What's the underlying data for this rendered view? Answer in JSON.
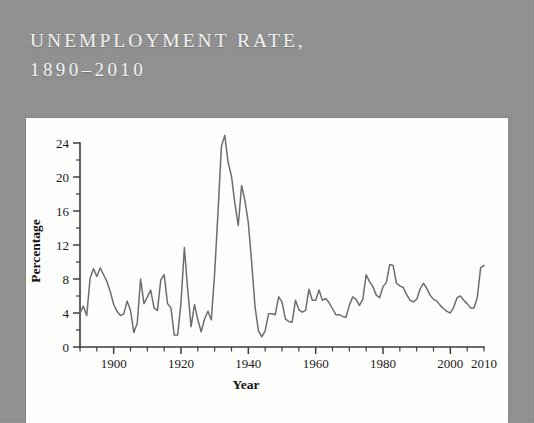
{
  "figure": {
    "background_color": "#909090",
    "panel_color": "#fdfdfb",
    "title_color": "#f2f2f2",
    "line_color": "#6d6d6d",
    "title_line_1": "UNEMPLOYMENT RATE,",
    "title_line_2": "1890–2010"
  },
  "chart_data": {
    "type": "line",
    "title": "UNEMPLOYMENT RATE, 1890–2010",
    "xlabel": "Year",
    "ylabel": "Percentage",
    "xlim": [
      1890,
      2010
    ],
    "ylim": [
      0,
      24
    ],
    "grid": false,
    "legend": "none",
    "x_tick_labels": [
      "1900",
      "1920",
      "1940",
      "1960",
      "1980",
      "2000",
      "2010"
    ],
    "x_tick_values": [
      1900,
      1920,
      1940,
      1960,
      1980,
      2000,
      2010
    ],
    "x_minor_tick_step": 5,
    "y_tick_labels": [
      "0",
      "4",
      "8",
      "12",
      "16",
      "20",
      "24"
    ],
    "y_tick_values": [
      0,
      4,
      8,
      12,
      16,
      20,
      24
    ],
    "y_minor_tick_step": 2,
    "series": [
      {
        "name": "Unemployment rate",
        "color": "#6d6d6d",
        "x": [
          1890,
          1891,
          1892,
          1893,
          1894,
          1895,
          1896,
          1897,
          1898,
          1899,
          1900,
          1901,
          1902,
          1903,
          1904,
          1905,
          1906,
          1907,
          1908,
          1909,
          1910,
          1911,
          1912,
          1913,
          1914,
          1915,
          1916,
          1917,
          1918,
          1919,
          1920,
          1921,
          1922,
          1923,
          1924,
          1925,
          1926,
          1927,
          1928,
          1929,
          1930,
          1931,
          1932,
          1933,
          1934,
          1935,
          1936,
          1937,
          1938,
          1939,
          1940,
          1941,
          1942,
          1943,
          1944,
          1945,
          1946,
          1947,
          1948,
          1949,
          1950,
          1951,
          1952,
          1953,
          1954,
          1955,
          1956,
          1957,
          1958,
          1959,
          1960,
          1961,
          1962,
          1963,
          1964,
          1965,
          1966,
          1967,
          1968,
          1969,
          1970,
          1971,
          1972,
          1973,
          1974,
          1975,
          1976,
          1977,
          1978,
          1979,
          1980,
          1981,
          1982,
          1983,
          1984,
          1985,
          1986,
          1987,
          1988,
          1989,
          1990,
          1991,
          1992,
          1993,
          1994,
          1995,
          1996,
          1997,
          1998,
          1999,
          2000,
          2001,
          2002,
          2003,
          2004,
          2005,
          2006,
          2007,
          2008,
          2009,
          2010
        ],
        "values": [
          4.0,
          4.8,
          3.7,
          8.1,
          9.2,
          8.3,
          9.3,
          8.5,
          7.7,
          6.5,
          5.0,
          4.2,
          3.7,
          3.9,
          5.4,
          4.3,
          1.7,
          2.8,
          8.0,
          5.1,
          5.9,
          6.7,
          4.6,
          4.3,
          7.9,
          8.5,
          5.1,
          4.6,
          1.4,
          1.4,
          5.2,
          11.7,
          6.7,
          2.4,
          5.0,
          3.2,
          1.8,
          3.3,
          4.2,
          3.2,
          8.7,
          15.9,
          23.6,
          24.9,
          21.7,
          20.1,
          16.9,
          14.3,
          19.0,
          17.2,
          14.6,
          9.9,
          4.7,
          1.9,
          1.2,
          1.9,
          3.9,
          3.9,
          3.8,
          5.9,
          5.3,
          3.3,
          3.0,
          2.9,
          5.5,
          4.4,
          4.1,
          4.3,
          6.8,
          5.5,
          5.5,
          6.7,
          5.5,
          5.7,
          5.2,
          4.5,
          3.8,
          3.8,
          3.6,
          3.5,
          4.9,
          5.9,
          5.6,
          4.9,
          5.6,
          8.5,
          7.7,
          7.1,
          6.1,
          5.8,
          7.1,
          7.6,
          9.7,
          9.6,
          7.5,
          7.2,
          7.0,
          6.2,
          5.5,
          5.3,
          5.6,
          6.8,
          7.5,
          6.9,
          6.1,
          5.6,
          5.4,
          4.9,
          4.5,
          4.2,
          4.0,
          4.7,
          5.8,
          6.0,
          5.5,
          5.1,
          4.6,
          4.6,
          5.8,
          9.3,
          9.6
        ]
      }
    ],
    "notable_points": [
      {
        "year": 1933,
        "value": 24.9,
        "label": "Great Depression peak"
      },
      {
        "year": 1944,
        "value": 1.2,
        "label": "WWII trough"
      },
      {
        "year": 1982,
        "value": 9.7,
        "label": "Early 1980s recession"
      },
      {
        "year": 2000,
        "value": 4.0,
        "label": "Late 1990s low"
      },
      {
        "year": 2010,
        "value": 9.6,
        "label": "Great Recession"
      }
    ]
  }
}
